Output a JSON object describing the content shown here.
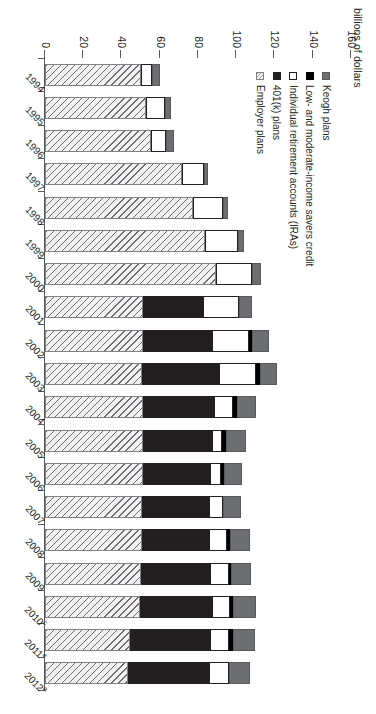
{
  "chart_data": {
    "type": "bar",
    "subtype": "stacked-horizontal",
    "title": "",
    "ylabel": "billions of dollars",
    "xlabel": "",
    "ylim": [
      0,
      160
    ],
    "ytick_labels": [
      "160",
      "140",
      "120",
      "100",
      "80",
      "60",
      "40",
      "20",
      "0"
    ],
    "ytick_values": [
      160,
      140,
      120,
      100,
      80,
      60,
      40,
      20,
      0
    ],
    "grid": false,
    "legend_position": "top-left",
    "categories": [
      "1994",
      "1995",
      "1996",
      "1997",
      "1998",
      "1999",
      "2000",
      "2001",
      "2002",
      "2003",
      "2004",
      "2005",
      "2006",
      "2007",
      "2008",
      "2009",
      "2010",
      "2011",
      "2012"
    ],
    "category_superscripts": [
      "",
      "",
      "",
      "",
      "",
      "",
      "",
      "",
      "",
      "",
      "",
      "",
      "",
      "",
      "",
      "",
      "c",
      "e",
      "a"
    ],
    "series": [
      {
        "name": "Employer plans",
        "swatch": "employer",
        "values": [
          50.0,
          53.0,
          55.5,
          71.5,
          77.5,
          83.5,
          89.5,
          51.5,
          51.0,
          50.5,
          51.0,
          51.5,
          51.0,
          50.5,
          50.5,
          50.0,
          49.5,
          44.5,
          43.5
        ]
      },
      {
        "name": "401(k) plans",
        "swatch": "k401",
        "values": [
          0.0,
          0.0,
          0.0,
          0.0,
          0.0,
          0.0,
          0.0,
          31.0,
          36.5,
          40.5,
          37.5,
          36.0,
          35.5,
          35.0,
          35.5,
          36.5,
          38.0,
          42.0,
          42.5
        ]
      },
      {
        "name": "Individual retirement accounts (IRAs)",
        "swatch": "ira",
        "values": [
          6.0,
          9.5,
          8.0,
          11.5,
          15.5,
          17.5,
          19.0,
          19.0,
          19.0,
          19.5,
          10.0,
          5.0,
          5.5,
          7.5,
          9.0,
          9.5,
          9.0,
          9.5,
          10.0
        ]
      },
      {
        "name": "Low- and moderate-income savers credit",
        "swatch": "savers",
        "values": [
          0.0,
          0.0,
          0.0,
          0.0,
          0.0,
          0.0,
          0.0,
          0.0,
          2.0,
          2.0,
          2.0,
          2.0,
          1.5,
          0.0,
          2.0,
          1.5,
          2.0,
          2.5,
          0.0
        ]
      },
      {
        "name": "Keogh plans",
        "swatch": "keogh",
        "values": [
          4.0,
          3.5,
          4.0,
          2.0,
          2.5,
          3.0,
          4.5,
          7.0,
          8.5,
          9.0,
          10.0,
          10.5,
          9.5,
          9.5,
          10.0,
          10.0,
          12.0,
          11.5,
          11.0
        ]
      }
    ],
    "totals": [
      60.0,
      66.0,
      67.5,
      85.0,
      95.5,
      104.0,
      113.0,
      108.5,
      117.0,
      121.5,
      110.5,
      105.0,
      103.0,
      102.5,
      107.0,
      107.5,
      110.5,
      110.0,
      107.0
    ]
  },
  "legend": {
    "items": [
      {
        "label": "Keogh plans",
        "swatch": "keogh"
      },
      {
        "label": "Low- and moderate-income savers credit",
        "swatch": "savers"
      },
      {
        "label": "Individual retirement accounts (IRAs)",
        "swatch": "ira"
      },
      {
        "label": "401(k) plans",
        "swatch": "k401"
      },
      {
        "label": "Employer plans",
        "swatch": "employer"
      }
    ]
  },
  "colors": {
    "keogh": "#6d6e71",
    "savers": "#000000",
    "ira": "#ffffff",
    "k401": "#231f20",
    "employer": "#f2f2f2",
    "axis": "#58595b",
    "text": "#231f20"
  }
}
